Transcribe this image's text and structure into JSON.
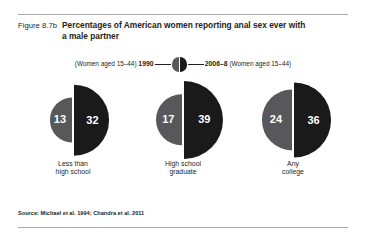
{
  "figure": {
    "number": "Figure 8.7b",
    "title": "Percentages of American women reporting anal sex ever with a male partner",
    "source": "Source: Michael et al. 1994; Chandra et al. 2011"
  },
  "legend": {
    "left_prefix": "(Women aged 15–44) ",
    "left_year": "1990",
    "right_year": "2006–8",
    "right_suffix": " (Women aged 15–44)",
    "left_color": "#58585a",
    "right_color": "#1a1a1a"
  },
  "chart_data": {
    "type": "pie",
    "title": "Percentages of American women reporting anal sex ever with a male partner",
    "subtitle": "",
    "xlabel": "",
    "ylabel": "Percent",
    "categories": [
      "Less than\nhigh school",
      "High school\ngraduate",
      "Any\ncollege"
    ],
    "series": [
      {
        "name": "1990",
        "values": [
          13,
          17,
          24
        ],
        "color": "#58585a",
        "note": "Women aged 15–44"
      },
      {
        "name": "2006–8",
        "values": [
          32,
          39,
          36
        ],
        "color": "#1a1a1a",
        "note": "Women aged 15–44"
      }
    ],
    "value_labels": [
      [
        "13",
        "32"
      ],
      [
        "17",
        "39"
      ],
      [
        "24",
        "36"
      ]
    ],
    "ylim": [
      0,
      40
    ],
    "grid": false,
    "legend_position": "top-center",
    "glyph": "paired half-discs sized in proportion to value"
  }
}
